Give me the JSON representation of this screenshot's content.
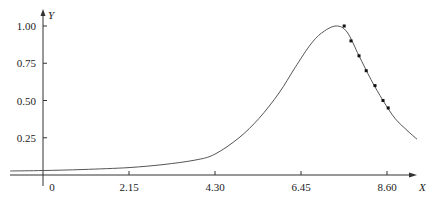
{
  "chart_data": {
    "type": "line",
    "title": "",
    "xlabel": "X",
    "ylabel": "Y",
    "xlim": [
      -0.82,
      9.35
    ],
    "ylim": [
      0,
      1.0
    ],
    "grid": false,
    "legend": null,
    "x_ticks": [
      {
        "value": 0,
        "label": "0"
      },
      {
        "value": 2.15,
        "label": "2.15"
      },
      {
        "value": 4.3,
        "label": "4.30"
      },
      {
        "value": 6.45,
        "label": "6.45"
      },
      {
        "value": 8.6,
        "label": "8.60"
      }
    ],
    "y_ticks": [
      {
        "value": 0.25,
        "label": "0.25"
      },
      {
        "value": 0.5,
        "label": "0.50"
      },
      {
        "value": 0.75,
        "label": "0.75"
      },
      {
        "value": 1.0,
        "label": "1.00"
      }
    ],
    "series": [
      {
        "name": "fitted-curve",
        "kind": "line",
        "color": "#555555",
        "x": [
          -0.82,
          0.0,
          1.0,
          2.15,
          3.0,
          3.8,
          4.3,
          4.9,
          5.4,
          5.9,
          6.3,
          6.7,
          7.0,
          7.33,
          7.6,
          7.9,
          8.2,
          8.5,
          8.8,
          9.1,
          9.35
        ],
        "y": [
          0.027,
          0.03,
          0.037,
          0.05,
          0.07,
          0.1,
          0.14,
          0.25,
          0.38,
          0.55,
          0.72,
          0.88,
          0.96,
          1.0,
          0.96,
          0.8,
          0.64,
          0.5,
          0.38,
          0.3,
          0.24
        ]
      },
      {
        "name": "observed-points",
        "kind": "scatter",
        "color": "#111111",
        "x": [
          7.53,
          7.7,
          7.9,
          8.08,
          8.3,
          8.5,
          8.63
        ],
        "y": [
          1.0,
          0.9,
          0.8,
          0.7,
          0.6,
          0.5,
          0.45
        ]
      }
    ]
  }
}
